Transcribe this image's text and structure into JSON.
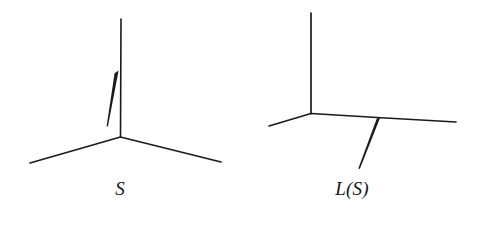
{
  "figure": {
    "background_color": "#ffffff",
    "stroke_color": "#1a1a1a",
    "width": 488,
    "height": 225,
    "panels": [
      {
        "id": "left-panel",
        "label": "S",
        "label_position": {
          "x": 118,
          "y": 190
        },
        "vertex": {
          "x": 120.5,
          "y": 137
        },
        "edges": [
          {
            "name": "vertical-edge",
            "kind": "thin",
            "from": {
              "x": 121,
              "y": 19
            },
            "to": {
              "x": 120.5,
              "y": 137
            },
            "width": 1.6
          },
          {
            "name": "lower-left-edge",
            "kind": "thin",
            "from": {
              "x": 120.5,
              "y": 137
            },
            "to": {
              "x": 30,
              "y": 163
            },
            "width": 1.6
          },
          {
            "name": "lower-right-edge",
            "kind": "thin",
            "from": {
              "x": 120.5,
              "y": 137
            },
            "to": {
              "x": 221,
              "y": 162
            },
            "width": 1.6
          },
          {
            "name": "tapered-wedge-edge",
            "kind": "tapered",
            "from": {
              "x": 117,
              "y": 72
            },
            "to": {
              "x": 107,
              "y": 126
            },
            "width_start": 4.2,
            "width_end": 1.2
          }
        ]
      },
      {
        "id": "right-panel",
        "label": "L(S)",
        "label_position": {
          "x": 352,
          "y": 190
        },
        "vertex": {
          "x": 311,
          "y": 113.5
        },
        "edges": [
          {
            "name": "vertical-edge",
            "kind": "thin",
            "from": {
              "x": 311,
              "y": 13
            },
            "to": {
              "x": 311,
              "y": 113.5
            },
            "width": 1.7
          },
          {
            "name": "lower-left-edge",
            "kind": "thin",
            "from": {
              "x": 311,
              "y": 113.5
            },
            "to": {
              "x": 269,
              "y": 126
            },
            "width": 1.7
          },
          {
            "name": "horizontal-right-edge",
            "kind": "thin-bent",
            "from": {
              "x": 311,
              "y": 113.5
            },
            "bend": {
              "x": 377,
              "y": 117.5
            },
            "to": {
              "x": 456,
              "y": 122
            },
            "width": 1.7
          },
          {
            "name": "tapered-wedge-edge",
            "kind": "tapered",
            "from": {
              "x": 378.5,
              "y": 118
            },
            "to": {
              "x": 359,
              "y": 169
            },
            "width_start": 3.4,
            "width_end": 1.6
          }
        ]
      }
    ]
  }
}
